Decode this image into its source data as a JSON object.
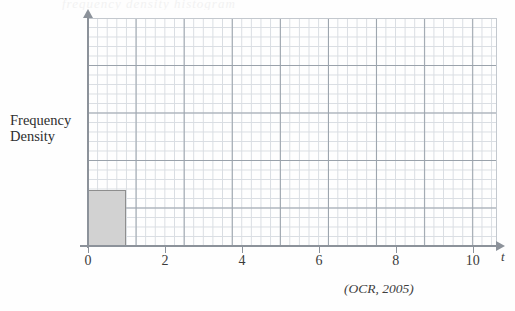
{
  "figure": {
    "ghost_text": "frequency density histogram",
    "attribution": "(OCR, 2005)",
    "y_axis_label_line1": "Frequency",
    "y_axis_label_line2": "Density",
    "x_axis_label": "t",
    "axis_color": "#8c929a",
    "grid_minor_color": "#d9dde2",
    "grid_major_color": "#9aa2ab",
    "bar_fill_color": "#d2d2d2",
    "bar_border_color": "#8e8e8e"
  },
  "chart_data": {
    "type": "bar",
    "title": "",
    "subtitle": "",
    "xlabel": "t",
    "ylabel": "Frequency Density",
    "xlim": [
      0,
      10.6
    ],
    "ylim": [
      0,
      6
    ],
    "grid": true,
    "legend": "none",
    "x_tick_labels": [
      "0",
      "2",
      "4",
      "6",
      "8",
      "10"
    ],
    "x_tick_values": [
      0,
      2,
      4,
      6,
      8,
      10
    ],
    "y_tick_labels": [],
    "bars": [
      {
        "label": "0 - 1",
        "x_start": 0,
        "x_end": 1,
        "height": 1.47
      }
    ],
    "annotations": [
      "(OCR, 2005)"
    ]
  }
}
